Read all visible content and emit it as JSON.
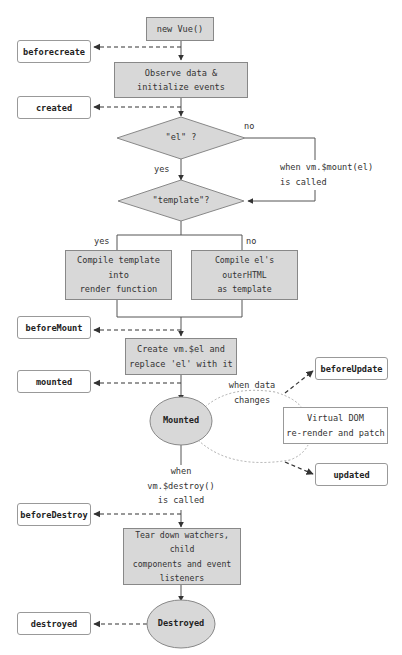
{
  "diagram": {
    "colors": {
      "process_fill": "#d8d8d8",
      "border": "#888888",
      "hook_border": "#999999",
      "line": "#555555"
    },
    "nodes": {
      "new_vue": "new Vue()",
      "observe": "Observe data &\ninitialize events",
      "el_decision": "\"el\" ?",
      "template_decision": "\"template\"?",
      "compile_template": "Compile template\ninto\nrender function",
      "compile_outer": "Compile el's outerHTML\nas template",
      "create_el": "Create vm.$el and\nreplace 'el' with it",
      "mounted_state": "Mounted",
      "virtual_dom": "Virtual DOM\nre-render and patch",
      "teardown": "Tear down watchers, child\ncomponents and event\nlisteners",
      "destroyed_state": "Destroyed"
    },
    "hooks": {
      "beforecreate": "beforecreate",
      "created": "created",
      "beforeMount": "beforeMount",
      "mounted": "mounted",
      "beforeUpdate": "beforeUpdate",
      "updated": "updated",
      "beforeDestroy": "beforeDestroy",
      "destroyed": "destroyed"
    },
    "edge_labels": {
      "el_no": "no",
      "el_yes": "yes",
      "mount_called": "when vm.$mount(el)\nis called",
      "template_yes": "yes",
      "template_no": "no",
      "data_changes": "when data\nchanges",
      "destroy_called": "when\nvm.$destroy()\nis called"
    }
  }
}
